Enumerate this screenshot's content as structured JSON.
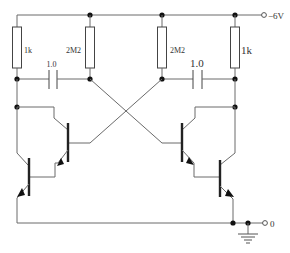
{
  "diagram": {
    "type": "circuit-schematic",
    "supply": {
      "label": "−6V",
      "terminal": "top-right"
    },
    "ground": {
      "label": "0",
      "terminal": "bottom-right"
    },
    "resistors": [
      {
        "id": "R1",
        "label": "1k",
        "position": "left collector load"
      },
      {
        "id": "R2",
        "label": "2M2",
        "position": "left base bias"
      },
      {
        "id": "R3",
        "label": "2M2",
        "position": "right base bias"
      },
      {
        "id": "R4",
        "label": "1k",
        "position": "right collector load"
      }
    ],
    "capacitors": [
      {
        "id": "C1",
        "label": "1.0",
        "position": "left cross-coupling"
      },
      {
        "id": "C2",
        "label": "1.0",
        "position": "right cross-coupling"
      }
    ],
    "transistors": [
      {
        "id": "TR1",
        "type": "PNP",
        "role": "left darlington input"
      },
      {
        "id": "TR2",
        "type": "PNP",
        "role": "left darlington output"
      },
      {
        "id": "TR3",
        "type": "PNP",
        "role": "right darlington input"
      },
      {
        "id": "TR4",
        "type": "PNP",
        "role": "right darlington output"
      }
    ],
    "colors": {
      "wire": "#6a6a6a",
      "component": "#333333",
      "background": "#ffffff"
    }
  }
}
